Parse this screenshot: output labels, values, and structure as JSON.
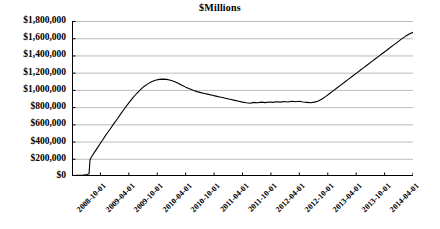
{
  "chart_data": {
    "type": "line",
    "title": "$Millions",
    "xlabel": "",
    "ylabel": "",
    "ylim": [
      0,
      1800000
    ],
    "grid": true,
    "legend": false,
    "y_ticks": [
      0,
      200000,
      400000,
      600000,
      800000,
      1000000,
      1200000,
      1400000,
      1600000,
      1800000
    ],
    "y_tick_labels": [
      "$0",
      "$200,000",
      "$400,000",
      "$600,000",
      "$800,000",
      "$1,000,000",
      "$1,200,000",
      "$1,400,000",
      "$1,600,000",
      "$1,800,000"
    ],
    "x_tick_labels": [
      "2008-10-01",
      "2009-04-01",
      "2009-10-01",
      "2010-04-01",
      "2010-10-01",
      "2011-04-01",
      "2011-10-01",
      "2012-04-01",
      "2012-10-01",
      "2013-04-01",
      "2013-10-01",
      "2014-04-01"
    ],
    "line_color": "#000000",
    "grid_color": "#b3b3b3",
    "axis_color": "#000000",
    "series": [
      {
        "name": "Total",
        "x": [
          "2008-10-01",
          "2008-11-01",
          "2008-12-01",
          "2009-01-01",
          "2009-02-01",
          "2009-03-01",
          "2009-04-01",
          "2009-05-01",
          "2009-06-01",
          "2009-07-01",
          "2009-08-01",
          "2009-09-01",
          "2009-10-01",
          "2009-11-01",
          "2009-12-01",
          "2010-01-01",
          "2010-02-01",
          "2010-03-01",
          "2010-04-01",
          "2010-05-01",
          "2010-06-01",
          "2010-07-01",
          "2010-08-01",
          "2010-09-01",
          "2010-10-01",
          "2010-11-01",
          "2010-12-01",
          "2011-01-01",
          "2011-02-01",
          "2011-03-01",
          "2011-04-01",
          "2011-05-01",
          "2011-06-01",
          "2011-07-01",
          "2011-08-01",
          "2011-09-01",
          "2011-10-01",
          "2011-11-01",
          "2011-12-01",
          "2012-01-01",
          "2012-02-01",
          "2012-03-01",
          "2012-04-01",
          "2012-05-01",
          "2012-06-01",
          "2012-07-01",
          "2012-08-01",
          "2012-09-01",
          "2012-10-01",
          "2012-11-01",
          "2012-12-01",
          "2013-01-01",
          "2013-02-01",
          "2013-03-01",
          "2013-04-01",
          "2013-05-01",
          "2013-06-01",
          "2013-07-01",
          "2013-08-01",
          "2013-09-01",
          "2013-10-01",
          "2013-11-01",
          "2013-12-01",
          "2014-01-01",
          "2014-02-01",
          "2014-03-01",
          "2014-04-01"
        ],
        "values": [
          5000,
          6000,
          8000,
          10000,
          12000,
          15000,
          20000,
          175000,
          215000,
          250000,
          300000,
          345000,
          395000,
          450000,
          505000,
          560000,
          615000,
          675000,
          745000,
          820000,
          880000,
          940000,
          990000,
          1040000,
          1080000,
          1105000,
          1120000,
          1125000,
          1120000,
          1105000,
          1080000,
          1050000,
          1020000,
          995000,
          975000,
          960000,
          945000,
          935000,
          925000,
          915000,
          905000,
          895000,
          885000,
          875000,
          868000,
          860000,
          852000,
          848000,
          855000,
          852000,
          858000,
          862000,
          865000,
          868000,
          870000,
          865000,
          858000,
          852000,
          855000,
          862000,
          880000,
          915000,
          960000,
          1010000,
          1060000,
          1105000,
          1155000
        ]
      }
    ],
    "series_full": {
      "note": "dense monthly detail of the plotted polyline in chart units",
      "points": [
        [
          0,
          5000
        ],
        [
          6,
          8000
        ],
        [
          12,
          12000
        ],
        [
          16,
          18000
        ],
        [
          18,
          25000
        ],
        [
          19,
          190000
        ],
        [
          21,
          230000
        ],
        [
          24,
          280000
        ],
        [
          27,
          330000
        ],
        [
          30,
          380000
        ],
        [
          33,
          430000
        ],
        [
          36,
          480000
        ],
        [
          40,
          540000
        ],
        [
          44,
          605000
        ],
        [
          48,
          665000
        ],
        [
          52,
          730000
        ],
        [
          56,
          790000
        ],
        [
          60,
          850000
        ],
        [
          64,
          905000
        ],
        [
          68,
          955000
        ],
        [
          72,
          1000000
        ],
        [
          76,
          1040000
        ],
        [
          80,
          1070000
        ],
        [
          84,
          1095000
        ],
        [
          88,
          1112000
        ],
        [
          92,
          1122000
        ],
        [
          96,
          1125000
        ],
        [
          100,
          1122000
        ],
        [
          104,
          1112000
        ],
        [
          108,
          1098000
        ],
        [
          112,
          1078000
        ],
        [
          116,
          1055000
        ],
        [
          120,
          1032000
        ],
        [
          124,
          1012000
        ],
        [
          128,
          995000
        ],
        [
          132,
          980000
        ],
        [
          136,
          968000
        ],
        [
          140,
          958000
        ],
        [
          144,
          948000
        ],
        [
          148,
          938000
        ],
        [
          152,
          928000
        ],
        [
          156,
          918000
        ],
        [
          160,
          908000
        ],
        [
          164,
          898000
        ],
        [
          168,
          888000
        ],
        [
          172,
          878000
        ],
        [
          176,
          868000
        ],
        [
          180,
          858000
        ],
        [
          184,
          850000
        ],
        [
          188,
          845000
        ],
        [
          192,
          855000
        ],
        [
          196,
          850000
        ],
        [
          200,
          858000
        ],
        [
          204,
          852000
        ],
        [
          208,
          860000
        ],
        [
          212,
          855000
        ],
        [
          216,
          862000
        ],
        [
          220,
          858000
        ],
        [
          224,
          866000
        ],
        [
          228,
          860000
        ],
        [
          232,
          868000
        ],
        [
          236,
          862000
        ],
        [
          240,
          868000
        ],
        [
          244,
          860000
        ],
        [
          248,
          855000
        ],
        [
          252,
          850000
        ],
        [
          256,
          858000
        ],
        [
          260,
          872000
        ],
        [
          264,
          895000
        ],
        [
          268,
          925000
        ],
        [
          272,
          958000
        ],
        [
          276,
          992000
        ],
        [
          280,
          1025000
        ],
        [
          284,
          1058000
        ],
        [
          288,
          1092000
        ],
        [
          292,
          1125000
        ],
        [
          296,
          1158000
        ],
        [
          300,
          1192000
        ],
        [
          304,
          1225000
        ],
        [
          308,
          1258000
        ],
        [
          312,
          1292000
        ],
        [
          316,
          1325000
        ],
        [
          320,
          1358000
        ],
        [
          324,
          1392000
        ],
        [
          328,
          1425000
        ],
        [
          332,
          1458000
        ],
        [
          336,
          1492000
        ],
        [
          340,
          1525000
        ],
        [
          344,
          1558000
        ],
        [
          348,
          1592000
        ],
        [
          352,
          1622000
        ],
        [
          356,
          1650000
        ],
        [
          360,
          1668000
        ]
      ]
    }
  }
}
